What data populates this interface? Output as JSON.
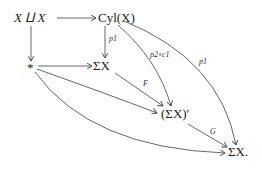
{
  "diagram": {
    "type": "commutative-diagram",
    "nodes": {
      "coproduct": "X ⨿ X",
      "cyl": "Cyl(X)",
      "point": "*",
      "suspension": "ΣX",
      "suspension_prime": "(ΣX)′",
      "suspension_end": "ΣX."
    },
    "arrows": {
      "coproduct_to_cyl": "",
      "coproduct_to_point": "",
      "cyl_to_suspension": "p1",
      "point_to_suspension": "",
      "point_to_suspension_prime": "",
      "point_to_suspension_end": "",
      "suspension_to_suspension_prime": "F",
      "cyl_to_suspension_prime": "p2∘c1",
      "cyl_to_suspension_end": "p1",
      "suspension_prime_to_suspension_end": "G"
    }
  }
}
